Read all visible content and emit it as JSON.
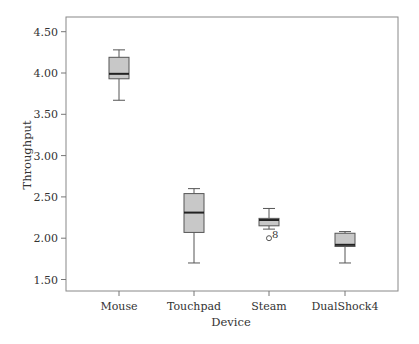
{
  "chart_data": {
    "type": "boxplot",
    "title": "",
    "xlabel": "Device",
    "ylabel": "Throughput",
    "ylim": [
      1.35,
      4.67
    ],
    "grid": false,
    "legend": null,
    "yticks": [
      1.5,
      2.0,
      2.5,
      3.0,
      3.5,
      4.0,
      4.5
    ],
    "ytick_labels": [
      "1.50",
      "2.00",
      "2.50",
      "3.00",
      "3.50",
      "4.00",
      "4.50"
    ],
    "categories": [
      "Mouse",
      "Touchpad",
      "Steam",
      "DualShock4"
    ],
    "series": [
      {
        "name": "Mouse",
        "whisker_low": 3.67,
        "q1": 3.93,
        "median": 3.99,
        "q3": 4.19,
        "whisker_high": 4.28,
        "outliers": []
      },
      {
        "name": "Touchpad",
        "whisker_low": 1.7,
        "q1": 2.07,
        "median": 2.31,
        "q3": 2.54,
        "whisker_high": 2.6,
        "outliers": []
      },
      {
        "name": "Steam",
        "whisker_low": 2.11,
        "q1": 2.15,
        "median": 2.22,
        "q3": 2.24,
        "whisker_high": 2.36,
        "outliers": [
          {
            "value": 2.0,
            "label": "8"
          }
        ]
      },
      {
        "name": "DualShock4",
        "whisker_low": 1.7,
        "q1": 1.9,
        "median": 1.92,
        "q3": 2.06,
        "whisker_high": 2.08,
        "outliers": []
      }
    ],
    "colors": {
      "box_fill": "#c8c8c8",
      "box_stroke": "#555555",
      "median": "#222222",
      "axis": "#777777"
    }
  }
}
